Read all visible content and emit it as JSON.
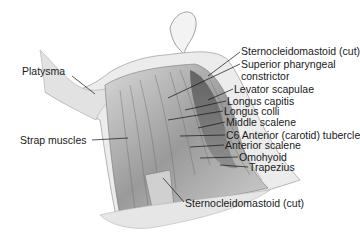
{
  "diagram": {
    "labels": [
      {
        "id": "platysma",
        "text": "Platysma",
        "x": 22,
        "y": 66
      },
      {
        "id": "strap-muscles",
        "text": "Strap muscles",
        "x": 20,
        "y": 135
      },
      {
        "id": "scm-cut-top",
        "text": "Sternocleidomastoid (cut)",
        "x": 241,
        "y": 46
      },
      {
        "id": "superior-pharyngeal",
        "text": "Superior pharyngeal",
        "x": 241,
        "y": 59
      },
      {
        "id": "constrictor",
        "text": "constrictor",
        "x": 241,
        "y": 71
      },
      {
        "id": "levator-scapulae",
        "text": "Levator scapulae",
        "x": 234,
        "y": 84
      },
      {
        "id": "longus-capitis",
        "text": "Longus capitis",
        "x": 227,
        "y": 96
      },
      {
        "id": "longus-colli",
        "text": "Longus colli",
        "x": 224,
        "y": 106
      },
      {
        "id": "middle-scalene",
        "text": "Middle scalene",
        "x": 226,
        "y": 117
      },
      {
        "id": "c6-tubercle",
        "text": "C6 Anterior (carotid) tubercle",
        "x": 226,
        "y": 130
      },
      {
        "id": "anterior-scalene",
        "text": "Anterior scalene",
        "x": 225,
        "y": 140
      },
      {
        "id": "omohyoid",
        "text": "Omohyoid",
        "x": 239,
        "y": 152
      },
      {
        "id": "trapezius",
        "text": "Trapezius",
        "x": 249,
        "y": 162
      },
      {
        "id": "scm-cut-bottom",
        "text": "Sternocleidomastoid (cut)",
        "x": 185,
        "y": 198
      }
    ]
  }
}
